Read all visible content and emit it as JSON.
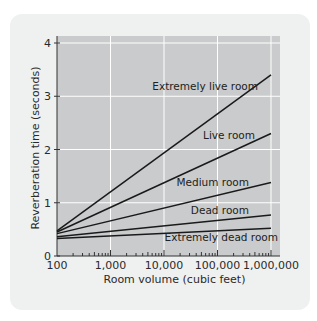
{
  "chart_data": {
    "type": "line",
    "title": "",
    "xlabel": "Room volume (cubic feet)",
    "ylabel": "Reverberation time (seconds)",
    "xscale": "log",
    "xlim": [
      100,
      1000000
    ],
    "ylim": [
      0,
      4
    ],
    "grid": true,
    "x_ticks": [
      100,
      1000,
      10000,
      100000,
      1000000
    ],
    "x_tick_labels": [
      "100",
      "1,000",
      "10,000",
      "100,000",
      "1,000,000"
    ],
    "y_ticks": [
      0,
      1,
      2,
      3,
      4
    ],
    "y_tick_labels": [
      "0",
      "1",
      "2",
      "3",
      "4"
    ],
    "series": [
      {
        "name": "Extremely live room",
        "x": [
          100,
          1000000
        ],
        "y": [
          0.47,
          3.4
        ]
      },
      {
        "name": "Live room",
        "x": [
          100,
          1000000
        ],
        "y": [
          0.45,
          2.3
        ]
      },
      {
        "name": "Medium room",
        "x": [
          100,
          1000000
        ],
        "y": [
          0.42,
          1.38
        ]
      },
      {
        "name": "Dead room",
        "x": [
          100,
          1000000
        ],
        "y": [
          0.36,
          0.77
        ]
      },
      {
        "name": "Extremely dead room",
        "x": [
          100,
          1000000
        ],
        "y": [
          0.33,
          0.52
        ]
      }
    ],
    "colors": {
      "plot_background": "#c9cbcc",
      "grid": "#ffffff",
      "line": "#1a1a1a",
      "card_background": "#eff0f0"
    }
  }
}
